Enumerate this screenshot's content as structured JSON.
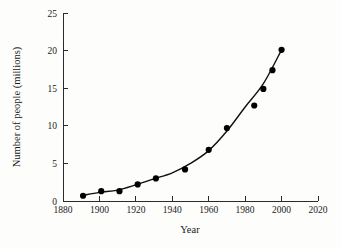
{
  "chart_data": {
    "type": "scatter",
    "title": "",
    "subtitle": "",
    "xlabel": "Year",
    "ylabel": "Number of people (millions)",
    "xlim": [
      1880,
      2020
    ],
    "ylim": [
      0,
      25
    ],
    "xticks": [
      1880,
      1900,
      1920,
      1940,
      1960,
      1980,
      2000,
      2020
    ],
    "yticks": [
      0,
      5,
      10,
      15,
      20,
      25
    ],
    "xtick_labels": [
      "1880",
      "1900",
      "1920",
      "1940",
      "1960",
      "1980",
      "2000",
      "2020"
    ],
    "ytick_labels": [
      "0",
      "5",
      "10",
      "15",
      "20",
      "25"
    ],
    "grid": false,
    "legend": "none",
    "series": [
      {
        "name": "Number of people",
        "marker": "filled-circle",
        "color": "#000000",
        "x": [
          1891,
          1901,
          1911,
          1921,
          1931,
          1947,
          1960,
          1970,
          1985,
          1990,
          1995,
          2000
        ],
        "y": [
          0.7,
          1.3,
          1.3,
          2.2,
          3.0,
          4.2,
          6.8,
          9.7,
          12.7,
          14.9,
          17.4,
          20.1
        ]
      },
      {
        "name": "Exponential fit curve",
        "marker": "none",
        "color": "#111111",
        "type": "line",
        "x": [
          1891,
          1900,
          1910,
          1920,
          1930,
          1940,
          1950,
          1960,
          1970,
          1980,
          1990,
          2000
        ],
        "y": [
          0.75,
          1.15,
          1.45,
          2.15,
          2.95,
          3.75,
          5.0,
          6.7,
          9.3,
          12.5,
          15.6,
          20.1
        ]
      }
    ]
  },
  "axes": {
    "x_title": "Year",
    "y_title": "Number of people (millions)"
  }
}
